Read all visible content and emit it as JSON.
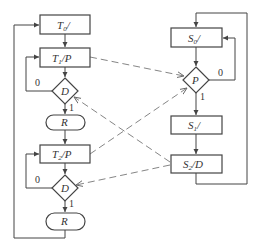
{
  "diagram": {
    "left_flow": {
      "t0": {
        "main": "T",
        "sub": "0",
        "suffix": "/"
      },
      "t1": {
        "main": "T",
        "sub": "1",
        "suffix": "/P"
      },
      "d1": {
        "label": "D",
        "no_label": "0",
        "yes_label": "1"
      },
      "r1": {
        "label": "R"
      },
      "t2": {
        "main": "T",
        "sub": "2",
        "suffix": "/P"
      },
      "d2": {
        "label": "D",
        "no_label": "0",
        "yes_label": "1"
      },
      "r2": {
        "label": "R"
      }
    },
    "right_flow": {
      "s0": {
        "main": "S",
        "sub": "0",
        "suffix": "/"
      },
      "p": {
        "label": "P",
        "no_label": "0",
        "yes_label": "1"
      },
      "s1": {
        "main": "S",
        "sub": "1",
        "suffix": "/"
      },
      "s2": {
        "main": "S",
        "sub": "2",
        "suffix": "/D"
      }
    },
    "colors": {
      "stroke": "#444444",
      "dashed": "#777777"
    }
  }
}
